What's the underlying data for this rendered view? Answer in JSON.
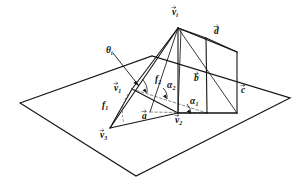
{
  "figure": {
    "kind": "geometry-diagram",
    "background_color": "#ffffff",
    "line_color": "#151515",
    "hidden_line_color": "#6a6a6a"
  },
  "labels": {
    "vertex_top": {
      "base": "v",
      "sub": "i",
      "vector": true
    },
    "vertex_left": {
      "base": "v",
      "sub": "1",
      "vector": true
    },
    "vertex_bottom": {
      "base": "v",
      "sub": "2",
      "vector": true
    },
    "vertex_far_left": {
      "base": "v",
      "sub": "3",
      "vector": true
    },
    "vector_a": {
      "base": "a",
      "sub": "",
      "vector": true
    },
    "vector_b": {
      "base": "b",
      "sub": "",
      "vector": true
    },
    "vector_c": {
      "base": "c",
      "sub": "",
      "vector": true
    },
    "vector_d": {
      "base": "d",
      "sub": "",
      "vector": true
    },
    "angle_theta": {
      "base": "θ",
      "sub": "i",
      "vector": false
    },
    "angle_alpha_1": {
      "base": "α",
      "sub": "1",
      "vector": false
    },
    "angle_alpha_2": {
      "base": "α",
      "sub": "2",
      "vector": false
    },
    "face_f1": {
      "base": "f",
      "sub": "1",
      "vector": false
    },
    "face_f2": {
      "base": "f",
      "sub": "2",
      "vector": false
    }
  },
  "geometry": {
    "plane_quad": "20,103 152,56 290,98 136,176",
    "apex": "178,28",
    "v1": "132,89",
    "v2": "178,113",
    "v3": "110,128",
    "back_top": "206,38",
    "back_bottom_b": "207,113",
    "right_top_d": "237,52",
    "right_bottom_c": "237,113",
    "ridge_inner": "181,30"
  }
}
